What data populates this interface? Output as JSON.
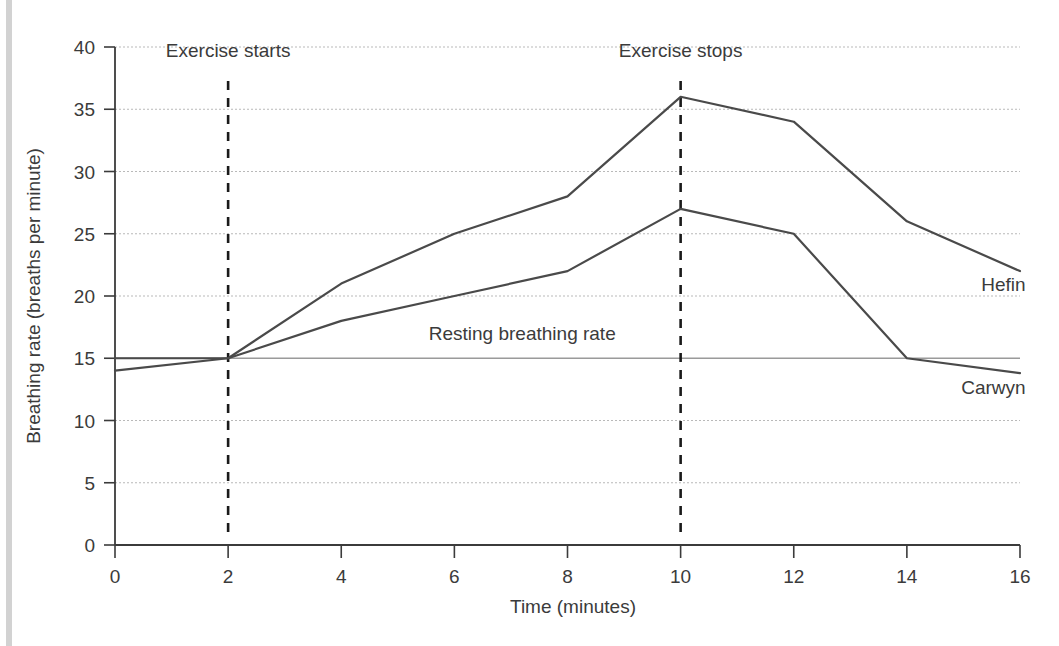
{
  "figure": {
    "name": "breathing-rate-line-chart"
  },
  "chart_data": {
    "type": "line",
    "title": "",
    "xlabel": "Time (minutes)",
    "ylabel": "Breathing rate (breaths per minute)",
    "xlim": [
      0,
      16
    ],
    "ylim": [
      0,
      40
    ],
    "xticks": [
      0,
      2,
      4,
      6,
      8,
      10,
      12,
      14,
      16
    ],
    "xtick_labels": [
      "0",
      "2",
      "4",
      "6",
      "8",
      "10",
      "12",
      "14",
      "16"
    ],
    "yticks": [
      0,
      5,
      10,
      15,
      20,
      25,
      30,
      35,
      40
    ],
    "ytick_labels": [
      "0",
      "5",
      "10",
      "15",
      "20",
      "25",
      "30",
      "35",
      "40"
    ],
    "grid": true,
    "grid_axis": "y",
    "legend_position": "inline-right-of-line-end",
    "x": [
      0,
      2,
      4,
      6,
      8,
      10,
      12,
      14,
      16
    ],
    "series": [
      {
        "name": "Hefin",
        "color": "#4a4a4a",
        "values": [
          15,
          15,
          21,
          25,
          28,
          36,
          34,
          26,
          22
        ]
      },
      {
        "name": "Carwyn",
        "color": "#4a4a4a",
        "values": [
          14,
          15,
          18,
          20,
          22,
          27,
          25,
          15,
          13.8
        ]
      }
    ],
    "reference_lines": [
      {
        "name": "Resting breathing rate",
        "orientation": "horizontal",
        "value": 15,
        "style": "solid",
        "color": "#9a9a9a",
        "label": "Resting breathing rate"
      },
      {
        "name": "Exercise starts",
        "orientation": "vertical",
        "value": 2,
        "style": "dashed",
        "color": "#1a1a1a",
        "label": "Exercise starts"
      },
      {
        "name": "Exercise stops",
        "orientation": "vertical",
        "value": 10,
        "style": "dashed",
        "color": "#1a1a1a",
        "label": "Exercise stops"
      }
    ],
    "annotations": [
      {
        "text": "Exercise starts",
        "x": 2,
        "y": 39.2,
        "anchor": "middle"
      },
      {
        "text": "Exercise stops",
        "x": 10,
        "y": 39.2,
        "anchor": "middle"
      },
      {
        "text": "Resting breathing rate",
        "x": 7.2,
        "y": 16.5,
        "anchor": "middle"
      },
      {
        "text": "Hefin",
        "x": 16.1,
        "y": 20.4,
        "anchor": "end"
      },
      {
        "text": "Carwyn",
        "x": 16.1,
        "y": 12.1,
        "anchor": "end"
      }
    ]
  },
  "accent_colors": {
    "line": "#4a4a4a",
    "gridline": "#b9b9b9",
    "axis": "#3b3b3b",
    "event_marker": "#1a1a1a",
    "resting_reference": "#9a9a9a",
    "left_rule": "#d2d2d2",
    "background": "#ffffff"
  }
}
